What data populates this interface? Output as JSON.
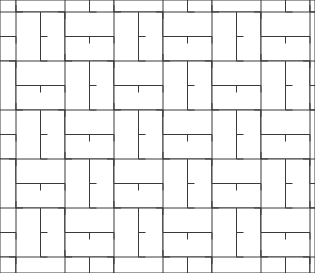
{
  "figure": {
    "kind": "brick-paving-pattern",
    "name": "Basketweave brick paving pattern",
    "background_color": "#ffffff",
    "line_color": "#3a3a3a",
    "line_width_px": 1,
    "width_px": 315,
    "height_px": 273
  },
  "chart_data": {
    "type": "diagram",
    "xlabel": "",
    "ylabel": "",
    "grid": false,
    "legend": "none",
    "module": {
      "brick_short_side_px": 24.5,
      "brick_long_side_px": 73.5,
      "aspect_ratio": "3:1",
      "block_pitch_px": 49,
      "origin_x_px": 16,
      "origin_y_px": 12,
      "tick_len_px": 7,
      "courses_per_block": 3
    },
    "blocks": [
      {
        "col": 0,
        "row": 0,
        "orientation": "horizontal"
      },
      {
        "col": 0,
        "row": 1,
        "orientation": "vertical"
      },
      {
        "col": 0,
        "row": 2,
        "orientation": "horizontal"
      },
      {
        "col": 0,
        "row": 3,
        "orientation": "vertical"
      },
      {
        "col": 1,
        "row": 0,
        "orientation": "vertical"
      },
      {
        "col": 1,
        "row": 1,
        "orientation": "horizontal"
      },
      {
        "col": 1,
        "row": 2,
        "orientation": "vertical"
      },
      {
        "col": 1,
        "row": 3,
        "orientation": "horizontal"
      },
      {
        "col": 2,
        "row": 0,
        "orientation": "horizontal"
      },
      {
        "col": 2,
        "row": 1,
        "orientation": "vertical"
      },
      {
        "col": 2,
        "row": 2,
        "orientation": "horizontal"
      },
      {
        "col": 2,
        "row": 3,
        "orientation": "vertical"
      },
      {
        "col": 3,
        "row": 0,
        "orientation": "vertical"
      },
      {
        "col": 3,
        "row": 1,
        "orientation": "horizontal"
      },
      {
        "col": 3,
        "row": 2,
        "orientation": "vertical"
      },
      {
        "col": 3,
        "row": 3,
        "orientation": "horizontal"
      },
      {
        "col": 4,
        "row": 0,
        "orientation": "horizontal"
      },
      {
        "col": 4,
        "row": 1,
        "orientation": "vertical"
      },
      {
        "col": 4,
        "row": 2,
        "orientation": "horizontal"
      },
      {
        "col": 4,
        "row": 3,
        "orientation": "vertical"
      },
      {
        "col": 5,
        "row": 0,
        "orientation": "vertical"
      },
      {
        "col": 5,
        "row": 1,
        "orientation": "horizontal"
      },
      {
        "col": 5,
        "row": 2,
        "orientation": "vertical"
      },
      {
        "col": 5,
        "row": 3,
        "orientation": "horizontal"
      }
    ]
  }
}
